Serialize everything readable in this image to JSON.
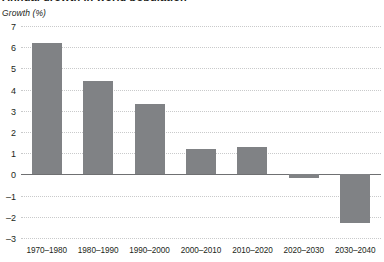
{
  "chart_data": {
    "type": "bar",
    "title": "Annual growth in world population",
    "subtitle": "",
    "axis_caption": "Growth (%)",
    "categories": [
      "1970–1980",
      "1980–1990",
      "1990–2000",
      "2000–2010",
      "2010–2020",
      "2020–2030",
      "2030–2040"
    ],
    "values": [
      6.2,
      4.4,
      3.3,
      1.2,
      1.3,
      -0.15,
      -2.3
    ],
    "xlabel": "",
    "ylabel": "Growth (%)",
    "ylim": [
      -3,
      7
    ],
    "yticks": [
      7,
      6,
      5,
      4,
      3,
      2,
      1,
      0,
      -1,
      -2,
      -3
    ],
    "ytick_labels": [
      "7",
      "6",
      "5",
      "4",
      "3",
      "2",
      "1",
      "0",
      "–1",
      "–2",
      "–3"
    ],
    "grid": true,
    "legend": null,
    "bar_color": "#808285",
    "grid_color": "#c9cacb",
    "zero_line_color": "#6f7072",
    "text_color": "#231f20"
  }
}
